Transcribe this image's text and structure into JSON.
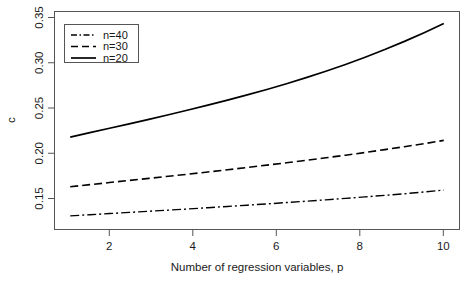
{
  "chart_data": {
    "type": "line",
    "title": "",
    "xlabel": "Number of regression variables, p",
    "ylabel": "c",
    "xlim": [
      0.6,
      10.9
    ],
    "ylim": [
      0.148,
      0.356
    ],
    "xticks": [
      2,
      4,
      6,
      8,
      10
    ],
    "xtick_labels": [
      "2",
      "4",
      "6",
      "8",
      "10"
    ],
    "yticks": [
      0.15,
      0.2,
      0.25,
      0.3,
      0.35
    ],
    "ytick_labels": [
      "0.15",
      "0.20",
      "0.25",
      "0.30",
      "0.35"
    ],
    "grid": false,
    "legend_position": "top-left",
    "x": [
      1,
      1.5,
      2,
      2.5,
      3,
      3.5,
      4,
      4.5,
      5,
      5.5,
      6,
      6.5,
      7,
      7.5,
      8,
      8.5,
      9,
      9.5,
      10,
      10.5
    ],
    "series": [
      {
        "name": "n=40",
        "label": "n=40",
        "linestyle": "dashdot",
        "color": "#000000",
        "values": [
          0.161,
          0.1621,
          0.1632,
          0.1643,
          0.1654,
          0.1665,
          0.1676,
          0.1688,
          0.17,
          0.1712,
          0.1724,
          0.1737,
          0.175,
          0.1763,
          0.1777,
          0.1791,
          0.1806,
          0.1821,
          0.1838,
          0.1856
        ]
      },
      {
        "name": "n=30",
        "label": "n=30",
        "linestyle": "dashed",
        "color": "#000000",
        "values": [
          0.1888,
          0.1908,
          0.1928,
          0.1948,
          0.1968,
          0.1988,
          0.2008,
          0.2029,
          0.205,
          0.2072,
          0.2094,
          0.2117,
          0.214,
          0.2164,
          0.2189,
          0.2215,
          0.2242,
          0.227,
          0.2299,
          0.233
        ]
      },
      {
        "name": "n=20",
        "label": "n=20",
        "linestyle": "solid",
        "color": "#000000",
        "values": [
          0.2362,
          0.2404,
          0.2446,
          0.2488,
          0.2531,
          0.2575,
          0.262,
          0.2666,
          0.2714,
          0.2764,
          0.2816,
          0.2871,
          0.2929,
          0.299,
          0.3055,
          0.3124,
          0.3197,
          0.3275,
          0.3358,
          0.3446
        ]
      }
    ]
  },
  "legend": {
    "entries": [
      {
        "label": "n=40",
        "style": "dashdot"
      },
      {
        "label": "n=30",
        "style": "dashed"
      },
      {
        "label": "n=20",
        "style": "solid"
      }
    ]
  },
  "axes": {
    "x_title": "Number of regression variables, p",
    "y_title": "c"
  },
  "colors": {
    "axis": "#555555",
    "line": "#000000",
    "text": "#1a1a1a",
    "background": "#ffffff"
  }
}
